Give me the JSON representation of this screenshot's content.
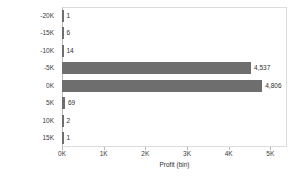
{
  "chart_data": {
    "type": "bar",
    "orientation": "horizontal",
    "title": "",
    "xlabel": "Profit (bin)",
    "ylabel": "",
    "categories": [
      "-20K",
      "-15K",
      "-10K",
      "-5K",
      "0K",
      "5K",
      "10K",
      "15K"
    ],
    "values": [
      1,
      6,
      14,
      4537,
      4806,
      69,
      2,
      1
    ],
    "value_labels": [
      "1",
      "6",
      "14",
      "4,537",
      "4,806",
      "69",
      "2",
      "1"
    ],
    "xlim": [
      0,
      5400
    ],
    "xticks": [
      0,
      1000,
      2000,
      3000,
      4000,
      5000
    ],
    "xtick_labels": [
      "0K",
      "1K",
      "2K",
      "3K",
      "4K",
      "5K"
    ],
    "grid": false,
    "legend": false,
    "bar_color": "#6e6e6e",
    "frame_color": "#dcdcdc",
    "text_color": "#3a3a3a"
  }
}
